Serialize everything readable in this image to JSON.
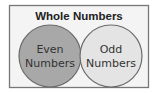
{
  "diagram": {
    "type": "venn",
    "title": "Whole Numbers",
    "sets": [
      {
        "label_line1": "Even",
        "label_line2": "Numbers",
        "color": "#a8a8a8"
      },
      {
        "label_line1": "Odd",
        "label_line2": "Numbers",
        "color": "#e4e4e4"
      }
    ],
    "colors": {
      "background": "#ffffff",
      "frame_fill": "#f4f4f4",
      "frame_stroke": "#777777",
      "circle_stroke": "#6a6a6a"
    }
  }
}
